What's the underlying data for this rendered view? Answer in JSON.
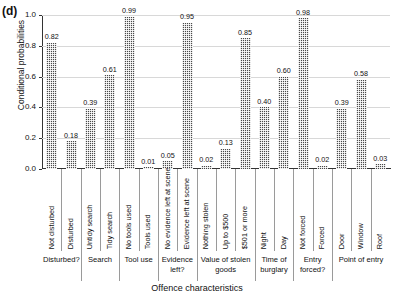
{
  "panel": {
    "label": "(d)"
  },
  "axes": {
    "ylabel": "Conditional probabilities",
    "xlabel": "Offence characteristics",
    "yticks": [
      "0.0",
      "0.2",
      "0.4",
      "0.6",
      "0.8",
      "1.0"
    ]
  },
  "chart_data": {
    "type": "bar",
    "title": "(d)",
    "xlabel": "Offence characteristics",
    "ylabel": "Conditional probabilities",
    "ylim": [
      0.0,
      1.0
    ],
    "ytick_values": [
      0.0,
      0.2,
      0.4,
      0.6,
      0.8,
      1.0
    ],
    "grid": true,
    "legend": "none",
    "categories": [
      "Not disturbed",
      "Disturbed",
      "Untidy search",
      "Tidy search",
      "No tools used",
      "Tools used",
      "No evidence left at scene",
      "Evidence left at scene",
      "Nothing stolen",
      "Up to $500",
      "$501 or more",
      "Night",
      "Day",
      "Not forced",
      "Forced",
      "Door",
      "Window",
      "Roof"
    ],
    "values": [
      0.82,
      0.18,
      0.39,
      0.61,
      0.99,
      0.01,
      0.05,
      0.95,
      0.02,
      0.13,
      0.85,
      0.4,
      0.6,
      0.98,
      0.02,
      0.39,
      0.58,
      0.03
    ],
    "data_labels": [
      "0.82",
      "0.18",
      "0.39",
      "0.61",
      "0.99",
      "0.01",
      "0.05",
      "0.95",
      "0.02",
      "0.13",
      "0.85",
      "0.40",
      "0.60",
      "0.98",
      "0.02",
      "0.39",
      "0.58",
      "0.03"
    ],
    "groups": [
      {
        "label": "Disturbed?",
        "categories": [
          "Not disturbed",
          "Disturbed"
        ]
      },
      {
        "label": "Search",
        "categories": [
          "Untidy search",
          "Tidy search"
        ]
      },
      {
        "label": "Tool use",
        "categories": [
          "No tools used",
          "Tools used"
        ]
      },
      {
        "label": "Evidence left?",
        "categories": [
          "No evidence left at scene",
          "Evidence left at scene"
        ]
      },
      {
        "label": "Value of stolen goods",
        "categories": [
          "Nothing stolen",
          "Up to $500",
          "$501 or more"
        ]
      },
      {
        "label": "Time of burglary",
        "categories": [
          "Night",
          "Day"
        ]
      },
      {
        "label": "Entry forced?",
        "categories": [
          "Not forced",
          "Forced"
        ]
      },
      {
        "label": "Point of entry",
        "categories": [
          "Door",
          "Window",
          "Roof"
        ]
      }
    ],
    "bar_color": "#4a4a4a",
    "bar_pattern": "dotted-crosshatch"
  }
}
